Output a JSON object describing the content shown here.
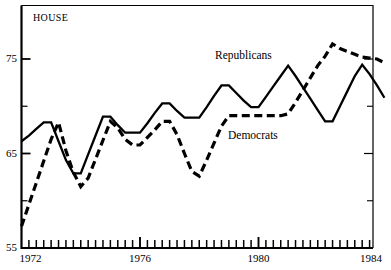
{
  "panel": {
    "title": "HOUSE"
  },
  "chart_data": {
    "type": "line",
    "title": "HOUSE",
    "xlabel": "",
    "ylabel": "",
    "xlim": [
      1972.0,
      1984.25
    ],
    "ylim": [
      55,
      79
    ],
    "grid": false,
    "legend_position": "inline-annotation",
    "y_ticks_labeled": [
      75,
      65,
      55
    ],
    "y_ticks_minor": [
      70,
      60
    ],
    "x_ticks_labeled": [
      1972,
      1976,
      1980,
      1984
    ],
    "x_tick_interval": 0.25,
    "x_tick_label_text": [
      "1972",
      "1976",
      "1980",
      "1984"
    ],
    "y_tick_label_text": [
      "75",
      "65",
      "55"
    ],
    "x": [
      1972.0,
      1972.25,
      1972.5,
      1972.75,
      1973.0,
      1973.25,
      1973.5,
      1973.75,
      1974.0,
      1974.25,
      1974.5,
      1974.75,
      1975.0,
      1975.25,
      1975.5,
      1975.75,
      1976.0,
      1976.25,
      1976.5,
      1976.75,
      1977.0,
      1977.25,
      1977.5,
      1977.75,
      1978.0,
      1978.25,
      1978.5,
      1978.75,
      1979.0,
      1979.25,
      1979.5,
      1979.75,
      1980.0,
      1980.25,
      1980.5,
      1980.75,
      1981.0,
      1981.25,
      1981.5,
      1981.75,
      1982.0,
      1982.25,
      1982.5,
      1982.75,
      1983.0,
      1983.25,
      1983.5,
      1983.75,
      1984.0,
      1984.25
    ],
    "series": [
      {
        "name": "Republicans",
        "label": "Republicans",
        "style": "solid",
        "color": "#000000",
        "values": [
          66.3,
          66.9,
          67.6,
          68.3,
          68.3,
          66.3,
          64.3,
          62.9,
          62.9,
          64.9,
          66.9,
          68.9,
          68.9,
          68.0,
          67.2,
          67.2,
          67.2,
          68.2,
          69.3,
          70.3,
          70.3,
          69.5,
          68.8,
          68.8,
          68.8,
          69.9,
          71.1,
          72.2,
          72.2,
          71.4,
          70.6,
          69.9,
          69.9,
          71.0,
          72.1,
          73.2,
          74.3,
          73.2,
          72.0,
          70.8,
          69.6,
          68.4,
          68.4,
          70.0,
          71.6,
          73.2,
          74.4,
          73.4,
          72.2,
          70.9
        ]
      },
      {
        "name": "Democrats",
        "label": "Democrats",
        "style": "dashed",
        "color": "#000000",
        "values": [
          57.3,
          59.6,
          61.9,
          64.2,
          66.5,
          68.3,
          65.3,
          63.0,
          61.5,
          62.4,
          64.4,
          66.4,
          68.4,
          67.7,
          66.5,
          65.9,
          65.9,
          66.7,
          67.5,
          68.4,
          68.4,
          67.0,
          65.0,
          63.1,
          62.6,
          64.3,
          66.1,
          67.9,
          69.0,
          69.0,
          69.0,
          69.0,
          69.0,
          69.0,
          69.0,
          69.0,
          69.2,
          70.4,
          71.7,
          73.0,
          74.3,
          75.3,
          76.6,
          76.1,
          75.8,
          75.5,
          75.2,
          75.1,
          75.0,
          74.6
        ]
      }
    ],
    "annotations": [
      {
        "text": "Republicans",
        "x": 1979.0,
        "y": 76.2
      },
      {
        "text": "Democrats",
        "x": 1979.3,
        "y": 67.5
      }
    ]
  },
  "axes": {
    "frame_color": "#000000"
  }
}
